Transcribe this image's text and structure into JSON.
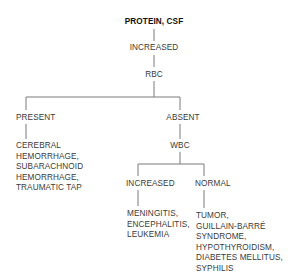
{
  "diagram": {
    "title": "PROTEIN, CSF",
    "root_finding": "INCREASED",
    "test_1": "RBC",
    "branch_present": {
      "label": "PRESENT",
      "causes": [
        "CEREBRAL",
        "HEMORRHAGE,",
        "SUBARACHNOID",
        "HEMORRHAGE,",
        "TRAUMATIC TAP"
      ]
    },
    "branch_absent": {
      "label": "ABSENT",
      "test_2": "WBC",
      "branch_increased": {
        "label": "INCREASED",
        "causes": [
          "MENINGITIS,",
          "ENCEPHALITIS,",
          "LEUKEMIA"
        ]
      },
      "branch_normal": {
        "label": "NORMAL",
        "causes": [
          "TUMOR,",
          "GUILLAIN-BARRÉ",
          "SYNDROME,",
          "HYPOTHYROIDISM,",
          "DIABETES MELLITUS,",
          "SYPHILIS"
        ]
      }
    }
  }
}
